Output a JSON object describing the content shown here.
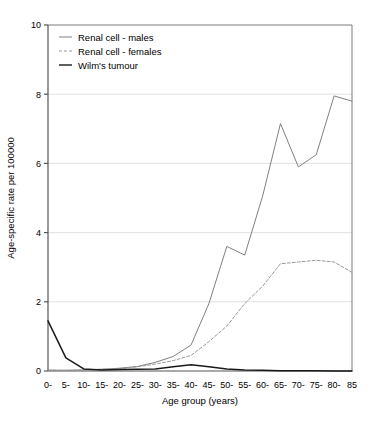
{
  "chart_data": {
    "type": "line",
    "title": "",
    "xlabel": "Age group (years)",
    "ylabel": "Age-specific rate per 100000",
    "categories": [
      "0-",
      "5-",
      "10-",
      "15-",
      "20-",
      "25-",
      "30-",
      "35-",
      "40-",
      "45-",
      "50-",
      "55-",
      "60-",
      "65-",
      "70-",
      "75-",
      "80-",
      "85"
    ],
    "x": [
      0,
      5,
      10,
      15,
      20,
      25,
      30,
      35,
      40,
      45,
      50,
      55,
      60,
      65,
      70,
      75,
      80,
      85
    ],
    "ylim": [
      0,
      10
    ],
    "yticks": [
      0,
      2,
      4,
      6,
      8,
      10
    ],
    "grid": "horizontal",
    "legend_position": "top-left",
    "series": [
      {
        "name": "Renal cell - males",
        "style": "solid",
        "color": "#808080",
        "values": [
          0.02,
          0.02,
          0.03,
          0.05,
          0.08,
          0.13,
          0.25,
          0.42,
          0.75,
          1.95,
          3.6,
          3.35,
          5.05,
          7.15,
          5.9,
          6.25,
          7.95,
          7.8
        ]
      },
      {
        "name": "Renal cell - females",
        "style": "dashed",
        "color": "#999999",
        "values": [
          0.03,
          0.02,
          0.03,
          0.05,
          0.07,
          0.12,
          0.2,
          0.3,
          0.45,
          0.85,
          1.3,
          1.95,
          2.45,
          3.1,
          3.15,
          3.2,
          3.15,
          2.85
        ]
      },
      {
        "name": "Wilm's tumour",
        "style": "solid",
        "color": "#1a1a1a",
        "values": [
          1.45,
          0.38,
          0.06,
          0.03,
          0.04,
          0.05,
          0.06,
          0.12,
          0.18,
          0.12,
          0.06,
          0.03,
          0.02,
          0.01,
          0.01,
          0.01,
          0.0,
          0.0
        ]
      }
    ]
  },
  "legend": {
    "entries": [
      {
        "label": "Renal cell - males"
      },
      {
        "label": "Renal cell - females"
      },
      {
        "label": "Wilm's tumour"
      }
    ]
  }
}
